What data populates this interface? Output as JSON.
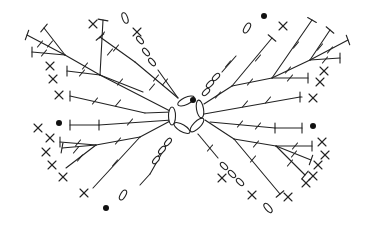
{
  "diagram": {
    "title": "Crochet butterfly chart",
    "width": 366,
    "height": 228,
    "stroke_color": "#222222",
    "background": "#ffffff",
    "legend": {
      "chain": "oval",
      "single_crochet": "x-cross",
      "double_crochet": "T with one slash",
      "half_double_crochet": "T",
      "slip_stitch": "filled dot"
    },
    "center_ring": [
      {
        "cx": 186,
        "cy": 101,
        "rx": 9,
        "ry": 3.5,
        "rot": -25
      },
      {
        "cx": 172,
        "cy": 116,
        "rx": 3.5,
        "ry": 9,
        "rot": 0
      },
      {
        "cx": 200,
        "cy": 109,
        "rx": 3.5,
        "ry": 9,
        "rot": -10
      },
      {
        "cx": 182,
        "cy": 128,
        "rx": 9,
        "ry": 3.5,
        "rot": 30
      },
      {
        "cx": 197,
        "cy": 125,
        "rx": 9,
        "ry": 3.5,
        "rot": -45
      }
    ],
    "dots": [
      {
        "cx": 193,
        "cy": 100
      },
      {
        "cx": 264,
        "cy": 16
      },
      {
        "cx": 59,
        "cy": 123
      },
      {
        "cx": 313,
        "cy": 126
      },
      {
        "cx": 106,
        "cy": 208
      }
    ],
    "stems": [
      {
        "x1": 172,
        "y1": 112,
        "x2": 100,
        "y2": 75
      },
      {
        "x1": 100,
        "y1": 75,
        "x2": 65,
        "y2": 55
      },
      {
        "x1": 100,
        "y1": 75,
        "x2": 103,
        "y2": 20
      },
      {
        "x1": 100,
        "y1": 75,
        "x2": 67,
        "y2": 71
      },
      {
        "x1": 65,
        "y1": 55,
        "x2": 44,
        "y2": 28
      },
      {
        "x1": 65,
        "y1": 55,
        "x2": 27,
        "y2": 35
      },
      {
        "x1": 65,
        "y1": 55,
        "x2": 32,
        "y2": 52
      },
      {
        "x1": 145,
        "y1": 113,
        "x2": 70,
        "y2": 96
      },
      {
        "x1": 172,
        "y1": 112,
        "x2": 145,
        "y2": 113
      },
      {
        "x1": 100,
        "y1": 75,
        "x2": 143,
        "y2": 92
      },
      {
        "x1": 178,
        "y1": 98,
        "x2": 135,
        "y2": 62
      },
      {
        "x1": 135,
        "y1": 62,
        "x2": 100,
        "y2": 37
      },
      {
        "x1": 178,
        "y1": 98,
        "x2": 158,
        "y2": 70
      },
      {
        "x1": 204,
        "y1": 104,
        "x2": 232,
        "y2": 86
      },
      {
        "x1": 232,
        "y1": 86,
        "x2": 272,
        "y2": 78
      },
      {
        "x1": 272,
        "y1": 78,
        "x2": 310,
        "y2": 60
      },
      {
        "x1": 310,
        "y1": 60,
        "x2": 330,
        "y2": 30
      },
      {
        "x1": 310,
        "y1": 60,
        "x2": 348,
        "y2": 40
      },
      {
        "x1": 310,
        "y1": 60,
        "x2": 340,
        "y2": 58
      },
      {
        "x1": 272,
        "y1": 78,
        "x2": 308,
        "y2": 78
      },
      {
        "x1": 272,
        "y1": 78,
        "x2": 312,
        "y2": 20
      },
      {
        "x1": 232,
        "y1": 86,
        "x2": 272,
        "y2": 38
      },
      {
        "x1": 204,
        "y1": 114,
        "x2": 300,
        "y2": 97
      },
      {
        "x1": 300,
        "y1": 97,
        "x2": 302,
        "y2": 97
      },
      {
        "x1": 222,
        "y1": 72,
        "x2": 236,
        "y2": 56
      },
      {
        "x1": 172,
        "y1": 120,
        "x2": 99,
        "y2": 125
      },
      {
        "x1": 99,
        "y1": 125,
        "x2": 70,
        "y2": 125
      },
      {
        "x1": 172,
        "y1": 120,
        "x2": 140,
        "y2": 137
      },
      {
        "x1": 140,
        "y1": 137,
        "x2": 96,
        "y2": 145
      },
      {
        "x1": 96,
        "y1": 145,
        "x2": 60,
        "y2": 142
      },
      {
        "x1": 96,
        "y1": 145,
        "x2": 62,
        "y2": 148
      },
      {
        "x1": 96,
        "y1": 145,
        "x2": 66,
        "y2": 168
      },
      {
        "x1": 140,
        "y1": 137,
        "x2": 93,
        "y2": 188
      },
      {
        "x1": 167,
        "y1": 144,
        "x2": 150,
        "y2": 174
      },
      {
        "x1": 150,
        "y1": 174,
        "x2": 140,
        "y2": 185
      },
      {
        "x1": 210,
        "y1": 122,
        "x2": 275,
        "y2": 128
      },
      {
        "x1": 275,
        "y1": 128,
        "x2": 302,
        "y2": 128
      },
      {
        "x1": 205,
        "y1": 120,
        "x2": 234,
        "y2": 139
      },
      {
        "x1": 234,
        "y1": 139,
        "x2": 276,
        "y2": 146
      },
      {
        "x1": 276,
        "y1": 146,
        "x2": 312,
        "y2": 146
      },
      {
        "x1": 276,
        "y1": 146,
        "x2": 311,
        "y2": 160
      },
      {
        "x1": 276,
        "y1": 146,
        "x2": 305,
        "y2": 175
      },
      {
        "x1": 234,
        "y1": 139,
        "x2": 280,
        "y2": 194
      },
      {
        "x1": 198,
        "y1": 134,
        "x2": 218,
        "y2": 158
      }
    ],
    "caps": [
      {
        "x": 103,
        "y": 20,
        "a": 100
      },
      {
        "x": 44,
        "y": 28,
        "a": 40
      },
      {
        "x": 27,
        "y": 35,
        "a": 20
      },
      {
        "x": 32,
        "y": 52,
        "a": 0
      },
      {
        "x": 67,
        "y": 71,
        "a": 0
      },
      {
        "x": 70,
        "y": 96,
        "a": 0
      },
      {
        "x": 100,
        "y": 37,
        "a": 50
      },
      {
        "x": 99,
        "y": 125,
        "a": 0
      },
      {
        "x": 70,
        "y": 125,
        "a": 0
      },
      {
        "x": 312,
        "y": 20,
        "a": 120
      },
      {
        "x": 330,
        "y": 30,
        "a": 130
      },
      {
        "x": 348,
        "y": 40,
        "a": 160
      },
      {
        "x": 340,
        "y": 58,
        "a": 180
      },
      {
        "x": 308,
        "y": 78,
        "a": 180
      },
      {
        "x": 272,
        "y": 38,
        "a": 130
      },
      {
        "x": 302,
        "y": 128,
        "a": 180
      },
      {
        "x": 275,
        "y": 128,
        "a": 180
      },
      {
        "x": 60,
        "y": 142,
        "a": 0
      },
      {
        "x": 62,
        "y": 148,
        "a": 10
      },
      {
        "x": 312,
        "y": 146,
        "a": 180
      },
      {
        "x": 311,
        "y": 160,
        "a": 200
      },
      {
        "x": 305,
        "y": 175,
        "a": 220
      },
      {
        "x": 280,
        "y": 194,
        "a": 230
      },
      {
        "x": 300,
        "y": 97,
        "a": 180
      }
    ],
    "ticks": [
      {
        "x": 85,
        "y": 66
      },
      {
        "x": 120,
        "y": 82
      },
      {
        "x": 110,
        "y": 52
      },
      {
        "x": 102,
        "y": 35
      },
      {
        "x": 50,
        "y": 44
      },
      {
        "x": 40,
        "y": 44
      },
      {
        "x": 44,
        "y": 53
      },
      {
        "x": 82,
        "y": 73
      },
      {
        "x": 118,
        "y": 103
      },
      {
        "x": 95,
        "y": 101
      },
      {
        "x": 156,
        "y": 78
      },
      {
        "x": 152,
        "y": 87
      },
      {
        "x": 116,
        "y": 48
      },
      {
        "x": 165,
        "y": 82
      },
      {
        "x": 250,
        "y": 82
      },
      {
        "x": 288,
        "y": 70
      },
      {
        "x": 296,
        "y": 45
      },
      {
        "x": 258,
        "y": 58
      },
      {
        "x": 320,
        "y": 47
      },
      {
        "x": 330,
        "y": 50
      },
      {
        "x": 325,
        "y": 60
      },
      {
        "x": 290,
        "y": 78
      },
      {
        "x": 245,
        "y": 104
      },
      {
        "x": 268,
        "y": 100
      },
      {
        "x": 218,
        "y": 95
      },
      {
        "x": 228,
        "y": 64
      },
      {
        "x": 130,
        "y": 122
      },
      {
        "x": 118,
        "y": 141
      },
      {
        "x": 78,
        "y": 143
      },
      {
        "x": 76,
        "y": 150
      },
      {
        "x": 80,
        "y": 158
      },
      {
        "x": 115,
        "y": 163
      },
      {
        "x": 160,
        "y": 154
      },
      {
        "x": 240,
        "y": 124
      },
      {
        "x": 258,
        "y": 126
      },
      {
        "x": 256,
        "y": 144
      },
      {
        "x": 295,
        "y": 146
      },
      {
        "x": 294,
        "y": 154
      },
      {
        "x": 290,
        "y": 163
      },
      {
        "x": 253,
        "y": 159
      },
      {
        "x": 210,
        "y": 148
      }
    ],
    "chains": [
      {
        "cx": 125,
        "cy": 18,
        "rx": 2.6,
        "ry": 5.5,
        "rot": -20
      },
      {
        "cx": 140,
        "cy": 40,
        "rx": 2.3,
        "ry": 4.5,
        "rot": -40
      },
      {
        "cx": 146,
        "cy": 52,
        "rx": 2.3,
        "ry": 4.5,
        "rot": -40
      },
      {
        "cx": 152,
        "cy": 62,
        "rx": 2.3,
        "ry": 4.5,
        "rot": -40
      },
      {
        "cx": 247,
        "cy": 28,
        "rx": 2.6,
        "ry": 5.5,
        "rot": 30
      },
      {
        "cx": 210,
        "cy": 84,
        "rx": 2.3,
        "ry": 4.5,
        "rot": 45
      },
      {
        "cx": 216,
        "cy": 77,
        "rx": 2.3,
        "ry": 4.5,
        "rot": 45
      },
      {
        "cx": 206,
        "cy": 92,
        "rx": 2.3,
        "ry": 4.5,
        "rot": 45
      },
      {
        "cx": 156,
        "cy": 160,
        "rx": 2.3,
        "ry": 4.5,
        "rot": 40
      },
      {
        "cx": 162,
        "cy": 150,
        "rx": 2.3,
        "ry": 4.5,
        "rot": 40
      },
      {
        "cx": 168,
        "cy": 142,
        "rx": 2.3,
        "ry": 4.5,
        "rot": 40
      },
      {
        "cx": 123,
        "cy": 195,
        "rx": 2.6,
        "ry": 5.5,
        "rot": 30
      },
      {
        "cx": 224,
        "cy": 166,
        "rx": 2.3,
        "ry": 4.5,
        "rot": -45
      },
      {
        "cx": 232,
        "cy": 174,
        "rx": 2.3,
        "ry": 4.5,
        "rot": -45
      },
      {
        "cx": 240,
        "cy": 182,
        "rx": 2.3,
        "ry": 4.5,
        "rot": -45
      },
      {
        "cx": 268,
        "cy": 208,
        "rx": 2.6,
        "ry": 5.5,
        "rot": -40
      }
    ],
    "crosses": [
      {
        "x": 93,
        "y": 24
      },
      {
        "x": 137,
        "y": 32
      },
      {
        "x": 50,
        "y": 66
      },
      {
        "x": 53,
        "y": 79
      },
      {
        "x": 59,
        "y": 95
      },
      {
        "x": 283,
        "y": 26
      },
      {
        "x": 324,
        "y": 71
      },
      {
        "x": 320,
        "y": 82
      },
      {
        "x": 313,
        "y": 98
      },
      {
        "x": 50,
        "y": 138
      },
      {
        "x": 46,
        "y": 152
      },
      {
        "x": 52,
        "y": 165
      },
      {
        "x": 63,
        "y": 177
      },
      {
        "x": 84,
        "y": 193
      },
      {
        "x": 322,
        "y": 142
      },
      {
        "x": 325,
        "y": 155
      },
      {
        "x": 318,
        "y": 165
      },
      {
        "x": 313,
        "y": 176
      },
      {
        "x": 306,
        "y": 183
      },
      {
        "x": 252,
        "y": 195
      },
      {
        "x": 288,
        "y": 197
      },
      {
        "x": 222,
        "y": 178
      },
      {
        "x": 38,
        "y": 128
      }
    ]
  }
}
